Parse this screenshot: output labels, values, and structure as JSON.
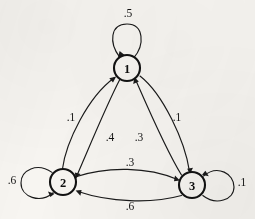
{
  "diagram": {
    "type": "state-transition-diagram",
    "title": "",
    "background_color": "#f7f5f1",
    "ink_color": "#1a1a1a",
    "nodes": [
      {
        "id": "1",
        "label": "1",
        "cx": 127,
        "cy": 68,
        "r": 13
      },
      {
        "id": "2",
        "label": "2",
        "cx": 63,
        "cy": 182,
        "r": 13
      },
      {
        "id": "3",
        "label": "3",
        "cx": 192,
        "cy": 185,
        "r": 13
      }
    ],
    "self_loops": [
      {
        "id": "loop-1",
        "node": "1",
        "label": ".5",
        "label_x": 128,
        "label_y": 13,
        "position": "above"
      },
      {
        "id": "loop-2",
        "node": "2",
        "label": ".6",
        "label_x": 12,
        "label_y": 180,
        "position": "left"
      },
      {
        "id": "loop-3",
        "node": "3",
        "label": ".1",
        "label_x": 242,
        "label_y": 182,
        "position": "right"
      }
    ],
    "edges": [
      {
        "id": "edge-2-1",
        "from": "2",
        "to": "1",
        "label": ".1",
        "label_x": 71,
        "label_y": 117
      },
      {
        "id": "edge-1-2",
        "from": "1",
        "to": "2",
        "label": ".4",
        "label_x": 110,
        "label_y": 137
      },
      {
        "id": "edge-3-1",
        "from": "3",
        "to": "1",
        "label": ".3",
        "label_x": 139,
        "label_y": 137
      },
      {
        "id": "edge-1-3",
        "from": "1",
        "to": "3",
        "label": ".1",
        "label_x": 177,
        "label_y": 117
      },
      {
        "id": "edge-2-3",
        "from": "2",
        "to": "3",
        "label": ".3",
        "label_x": 130,
        "label_y": 162
      },
      {
        "id": "edge-3-2",
        "from": "3",
        "to": "2",
        "label": ".6",
        "label_x": 130,
        "label_y": 206
      }
    ]
  }
}
